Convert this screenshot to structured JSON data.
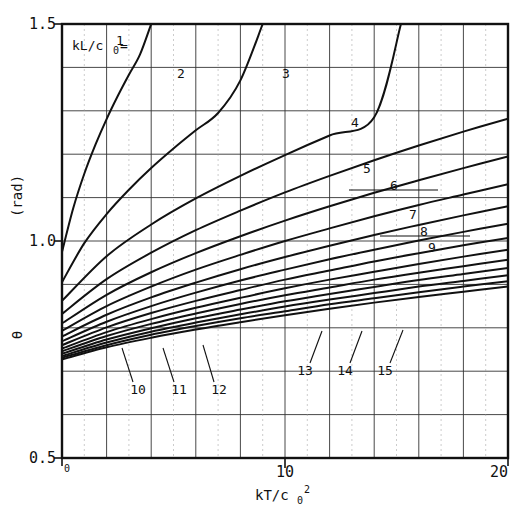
{
  "chart_data": {
    "type": "line",
    "title": "",
    "xlabel": "kT/c0^2",
    "ylabel": "theta (rad)",
    "xlim": [
      0,
      20
    ],
    "ylim": [
      0.5,
      1.5
    ],
    "xticks": [
      0,
      10,
      20
    ],
    "xticklabels": [
      "0",
      "10",
      "20"
    ],
    "yticks": [
      0.5,
      1.0,
      1.5
    ],
    "yticklabels": [
      "0.5",
      "1.0",
      "1.5"
    ],
    "grid": true,
    "grid_x_step": 2,
    "grid_y_step": 0.1,
    "legend": "none",
    "annotation": "kL/c0 = 1",
    "parameter_name": "kL/c0",
    "series": [
      {
        "name": "1",
        "param": 1,
        "x": [
          0,
          0.5,
          1,
          1.5,
          2,
          2.5,
          3,
          3.5,
          4
        ],
        "values": [
          0.975,
          1.075,
          1.155,
          1.222,
          1.281,
          1.334,
          1.383,
          1.43,
          1.5
        ]
      },
      {
        "name": "2",
        "param": 2,
        "x": [
          0,
          1,
          2,
          3,
          4,
          5,
          6,
          7,
          8,
          9
        ],
        "values": [
          0.905,
          0.995,
          1.062,
          1.118,
          1.168,
          1.213,
          1.255,
          1.295,
          1.37,
          1.5
        ]
      },
      {
        "name": "3",
        "param": 3,
        "x": [
          0,
          2,
          4,
          6,
          8,
          10,
          12,
          14,
          15.2
        ],
        "values": [
          0.862,
          0.965,
          1.038,
          1.098,
          1.15,
          1.198,
          1.243,
          1.285,
          1.5
        ]
      },
      {
        "name": "4",
        "param": 4,
        "x": [
          0,
          2,
          4,
          6,
          8,
          10,
          12,
          14,
          16,
          18,
          20
        ],
        "values": [
          0.832,
          0.912,
          0.973,
          1.025,
          1.07,
          1.112,
          1.15,
          1.186,
          1.22,
          1.252,
          1.282
        ]
      },
      {
        "name": "5",
        "param": 5,
        "x": [
          0,
          2,
          4,
          6,
          8,
          10,
          12,
          14,
          16,
          18,
          20
        ],
        "values": [
          0.81,
          0.876,
          0.928,
          0.972,
          1.011,
          1.047,
          1.08,
          1.111,
          1.14,
          1.168,
          1.195
        ]
      },
      {
        "name": "6",
        "param": 6,
        "x": [
          0,
          2,
          4,
          6,
          8,
          10,
          12,
          14,
          16,
          18,
          20
        ],
        "values": [
          0.793,
          0.85,
          0.895,
          0.934,
          0.968,
          1.0,
          1.029,
          1.057,
          1.083,
          1.107,
          1.131
        ]
      },
      {
        "name": "7",
        "param": 7,
        "x": [
          0,
          2,
          4,
          6,
          8,
          10,
          12,
          14,
          16,
          18,
          20
        ],
        "values": [
          0.78,
          0.83,
          0.87,
          0.904,
          0.935,
          0.963,
          0.989,
          1.014,
          1.037,
          1.059,
          1.08
        ]
      },
      {
        "name": "8",
        "param": 8,
        "x": [
          0,
          2,
          4,
          6,
          8,
          10,
          12,
          14,
          16,
          18,
          20
        ],
        "values": [
          0.769,
          0.814,
          0.85,
          0.881,
          0.909,
          0.934,
          0.958,
          0.98,
          1.001,
          1.021,
          1.04
        ]
      },
      {
        "name": "9",
        "param": 9,
        "x": [
          0,
          2,
          4,
          6,
          8,
          10,
          12,
          14,
          16,
          18,
          20
        ],
        "values": [
          0.76,
          0.801,
          0.834,
          0.862,
          0.887,
          0.911,
          0.932,
          0.953,
          0.972,
          0.99,
          1.007
        ]
      },
      {
        "name": "10",
        "param": 10,
        "x": [
          0,
          2,
          4,
          6,
          8,
          10,
          12,
          14,
          16,
          18,
          20
        ],
        "values": [
          0.752,
          0.79,
          0.82,
          0.846,
          0.869,
          0.891,
          0.911,
          0.929,
          0.947,
          0.964,
          0.98
        ]
      },
      {
        "name": "11",
        "param": 11,
        "x": [
          0,
          2,
          4,
          6,
          8,
          10,
          12,
          14,
          16,
          18,
          20
        ],
        "values": [
          0.746,
          0.781,
          0.809,
          0.833,
          0.855,
          0.875,
          0.893,
          0.911,
          0.927,
          0.942,
          0.957
        ]
      },
      {
        "name": "12",
        "param": 12,
        "x": [
          0,
          2,
          4,
          6,
          8,
          10,
          12,
          14,
          16,
          18,
          20
        ],
        "values": [
          0.74,
          0.773,
          0.799,
          0.822,
          0.842,
          0.861,
          0.878,
          0.894,
          0.91,
          0.924,
          0.938
        ]
      },
      {
        "name": "13",
        "param": 13,
        "x": [
          0,
          2,
          4,
          6,
          8,
          10,
          12,
          14,
          16,
          18,
          20
        ],
        "values": [
          0.735,
          0.766,
          0.791,
          0.812,
          0.831,
          0.849,
          0.865,
          0.88,
          0.895,
          0.908,
          0.921
        ]
      },
      {
        "name": "14",
        "param": 14,
        "x": [
          0,
          2,
          4,
          6,
          8,
          10,
          12,
          14,
          16,
          18,
          20
        ],
        "values": [
          0.731,
          0.76,
          0.784,
          0.804,
          0.822,
          0.838,
          0.854,
          0.868,
          0.882,
          0.895,
          0.907
        ]
      },
      {
        "name": "15",
        "param": 15,
        "x": [
          0,
          2,
          4,
          6,
          8,
          10,
          12,
          14,
          16,
          18,
          20
        ],
        "values": [
          0.727,
          0.755,
          0.777,
          0.796,
          0.813,
          0.829,
          0.844,
          0.858,
          0.871,
          0.883,
          0.895
        ]
      }
    ],
    "curve_labels": [
      {
        "text": "1",
        "x": 120,
        "y": 45,
        "leader": null
      },
      {
        "text": "2",
        "x": 181,
        "y": 78,
        "leader": null
      },
      {
        "text": "3",
        "x": 286,
        "y": 78,
        "leader": null
      },
      {
        "text": "4",
        "x": 355,
        "y": 127,
        "leader": null
      },
      {
        "text": "5",
        "x": 367,
        "y": 173,
        "leader": null
      },
      {
        "text": "6",
        "x": 394,
        "y": 190,
        "leader": {
          "x1": 349,
          "y1": 190,
          "x2": 438,
          "y2": 190
        }
      },
      {
        "text": "7",
        "x": 413,
        "y": 219,
        "leader": null
      },
      {
        "text": "8",
        "x": 424,
        "y": 236,
        "leader": {
          "x1": 380,
          "y1": 236,
          "x2": 470,
          "y2": 236
        }
      },
      {
        "text": "9",
        "x": 432,
        "y": 252,
        "leader": null
      },
      {
        "text": "10",
        "x": 138,
        "y": 394,
        "leader": {
          "x1": 133,
          "y1": 382,
          "x2": 122,
          "y2": 348
        }
      },
      {
        "text": "11",
        "x": 179,
        "y": 394,
        "leader": {
          "x1": 174,
          "y1": 382,
          "x2": 163,
          "y2": 348
        }
      },
      {
        "text": "12",
        "x": 219,
        "y": 394,
        "leader": {
          "x1": 214,
          "y1": 382,
          "x2": 203,
          "y2": 345
        }
      },
      {
        "text": "13",
        "x": 305,
        "y": 375,
        "leader": {
          "x1": 310,
          "y1": 363,
          "x2": 322,
          "y2": 331
        }
      },
      {
        "text": "14",
        "x": 345,
        "y": 375,
        "leader": {
          "x1": 350,
          "y1": 363,
          "x2": 362,
          "y2": 331
        }
      },
      {
        "text": "15",
        "x": 385,
        "y": 375,
        "leader": {
          "x1": 390,
          "y1": 363,
          "x2": 403,
          "y2": 330
        }
      }
    ]
  },
  "axes": {
    "y_label_main": "θ",
    "y_label_unit": "(rad)",
    "x_label_base": "kT/c",
    "x_label_sub": "0",
    "x_label_sup": "2",
    "ytick_top": "1.5",
    "ytick_mid": "1.0",
    "ytick_bot": "0.5",
    "xtick_left": "0",
    "xtick_mid": "10",
    "xtick_right": "20"
  },
  "annotation": {
    "base": "kL/c",
    "sub": "0",
    "eq": "=",
    "value": "1"
  },
  "colors": {
    "ink": "#111111",
    "grid": "#333333",
    "background": "#ffffff"
  }
}
